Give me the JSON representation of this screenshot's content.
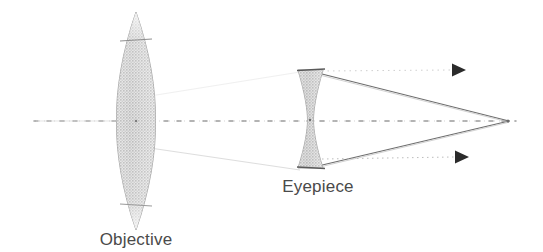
{
  "figure": {
    "background_color": "#ffffff",
    "ink_color": "#4a4a4a",
    "lens_fill_color": "#c9c9c9",
    "lens_edge_color": "#9a9a9a",
    "ray_color": "#6e6e6e",
    "axis_color": "#8d8d8d"
  },
  "labels": {
    "objective": "Objective",
    "eyepiece": "Eyepiece"
  },
  "optical_axis": {
    "name": "optical-axis",
    "style": "dashed",
    "y": 121,
    "x_start": 34,
    "x_end": 516
  },
  "objective_lens": {
    "name": "objective-lens",
    "type": "biconvex",
    "center_x": 136,
    "center_y": 121,
    "width": 38,
    "height": 218,
    "top": 12,
    "bottom": 230,
    "left": 117,
    "right": 155,
    "rim_top_y": 41,
    "rim_bottom_y": 204
  },
  "eyepiece_lens": {
    "name": "eyepiece-lens",
    "type": "biconcave",
    "center_x": 310,
    "center_y": 120,
    "width": 25,
    "height": 98,
    "top": 70,
    "bottom": 168,
    "left": 298,
    "right": 323
  },
  "rays": [
    {
      "name": "ray-upper-converging",
      "from_x": 320,
      "from_y": 74,
      "to_x": 508,
      "to_y": 121
    },
    {
      "name": "ray-lower-converging",
      "from_x": 320,
      "from_y": 165,
      "to_x": 508,
      "to_y": 121
    },
    {
      "name": "ray-upper-exit-horizontal",
      "from_x": 322,
      "from_y": 72,
      "to_x": 452,
      "to_y": 70
    },
    {
      "name": "ray-lower-exit-horizontal",
      "from_x": 322,
      "from_y": 160,
      "to_x": 455,
      "to_y": 157
    },
    {
      "name": "ray-objective-to-eyepiece-lower",
      "from_x": 148,
      "from_y": 152,
      "to_x": 300,
      "to_y": 168
    },
    {
      "name": "ray-incoming-left",
      "from_x": 36,
      "from_y": 121,
      "to_x": 118,
      "to_y": 121
    }
  ],
  "arrowheads": [
    {
      "name": "arrowhead-upper-ray",
      "x": 459,
      "y": 70,
      "direction": "right"
    },
    {
      "name": "arrowhead-lower-ray",
      "x": 462,
      "y": 157,
      "direction": "right"
    }
  ],
  "convergence_point": {
    "name": "ray-convergence-vertex",
    "x": 508,
    "y": 121
  },
  "label_positions": {
    "objective": {
      "x": 136,
      "y": 245,
      "anchor": "middle"
    },
    "eyepiece": {
      "x": 318,
      "y": 192,
      "anchor": "middle"
    }
  }
}
